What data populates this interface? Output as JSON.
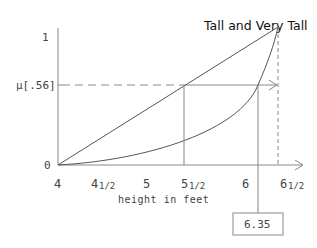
{
  "diagram": {
    "title": "Tall and Very Tall",
    "x_axis": {
      "label": "height in feet",
      "ticks": [
        {
          "main": "4",
          "sub": ""
        },
        {
          "main": "4",
          "sub": "1/2"
        },
        {
          "main": "5",
          "sub": ""
        },
        {
          "main": "5",
          "sub": "1/2"
        },
        {
          "main": "6",
          "sub": ""
        },
        {
          "main": "6",
          "sub": "1/2"
        }
      ]
    },
    "y_axis": {
      "top_label": "1",
      "bottom_label": "0",
      "mu_label": "μ[.56]"
    },
    "result_box": "6.35",
    "curves": [
      {
        "name": "tall",
        "type": "linear",
        "from": [
          4,
          0
        ],
        "to": [
          6.5,
          1
        ]
      },
      {
        "name": "very-tall",
        "type": "convex",
        "from": [
          4,
          0
        ],
        "to": [
          6.5,
          1
        ]
      }
    ],
    "membership_value": 0.56,
    "tall_height_at_mu": 5.5,
    "very_tall_height_at_mu": 6.35
  }
}
